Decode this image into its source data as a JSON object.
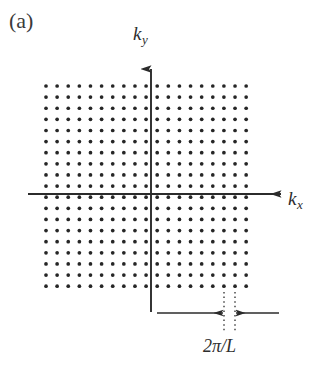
{
  "figure": {
    "panel_label": "(a)",
    "background_color": "#ffffff",
    "ink_color": "#2b2b2b"
  },
  "axes": {
    "y_axis": {
      "label": "k",
      "subscript": "y",
      "name": "ky-axis",
      "arrow_direction": "up",
      "x_px": 151,
      "top_px": 68,
      "bottom_px": 312
    },
    "x_axis": {
      "label": "k",
      "subscript": "x",
      "name": "kx-axis",
      "arrow_direction": "right",
      "y_px": 194,
      "left_px": 28,
      "right_px": 281
    }
  },
  "lattice": {
    "name": "k-point-lattice",
    "type": "square",
    "columns": 19,
    "rows": 19,
    "spacing_px": 11.12,
    "dot_radius_px": 1.85,
    "dot_color": "#262626",
    "origin_x_px": 151,
    "origin_y_px": 194,
    "first_dot_x_px": 46.0,
    "first_dot_y_px": 86.0
  },
  "annotation": {
    "name": "lattice-spacing-annotation",
    "label": "2π/L",
    "measure_y_px": 313,
    "left_arrow_start_px": 157,
    "left_arrow_end_px": 224,
    "right_arrow_start_px": 279,
    "right_arrow_end_px": 235,
    "guide_line_1_x_px": 224,
    "guide_line_2_x_px": 235,
    "guide_top_px": 292,
    "guide_bottom_px": 333,
    "guide_style": "dotted"
  }
}
